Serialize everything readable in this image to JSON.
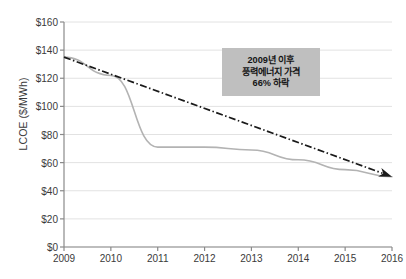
{
  "chart_data": {
    "type": "line",
    "title": "",
    "xlabel": "",
    "ylabel": "LCOE ($/MWh)",
    "categories": [
      "2009",
      "2010",
      "2011",
      "2012",
      "2013",
      "2014",
      "2015",
      "2016"
    ],
    "x": [
      2009,
      2010,
      2011,
      2012,
      2013,
      2014,
      2015,
      2016
    ],
    "xlim": [
      2009,
      2016
    ],
    "ylim": [
      0,
      160
    ],
    "ytick_values": [
      0,
      20,
      40,
      60,
      80,
      100,
      120,
      140,
      160
    ],
    "ytick_labels": [
      "$0",
      "$20",
      "$40",
      "$60",
      "$80",
      "$100",
      "$120",
      "$140",
      "$160"
    ],
    "grid": "horizontal",
    "legend": "none",
    "series": [
      {
        "name": "LCOE",
        "style": "solid",
        "color": "#b3b3b3",
        "values": [
          135,
          122,
          71,
          71,
          69,
          62,
          55,
          50
        ]
      },
      {
        "name": "Trend",
        "style": "dash-dot-arrow",
        "color": "#1a1a1a",
        "values": [
          135,
          122,
          110,
          98,
          86,
          74,
          62,
          50
        ]
      }
    ],
    "annotations": [
      {
        "name": "wind-price-callout",
        "lines": [
          "2009년 이후",
          "풍력에너지 가격",
          "66% 하락"
        ],
        "background": "#bfbfbf",
        "text_color": "#141414"
      }
    ]
  },
  "axis": {
    "y_title": "LCOE ($/MWh)"
  },
  "colors": {
    "series_line": "#b3b3b3",
    "trend_line": "#1a1a1a",
    "grid": "#e2e2e2",
    "axis": "#8a8a8a",
    "tick_text": "#3a3a3a",
    "annotation_bg": "#bfbfbf"
  }
}
